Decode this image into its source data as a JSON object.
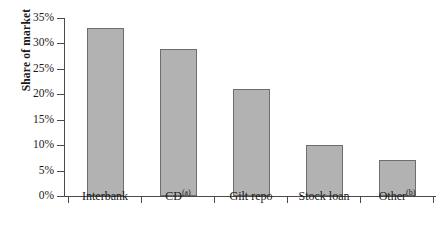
{
  "chart_data": {
    "type": "bar",
    "title": "",
    "xlabel": "",
    "ylabel": "Share of market",
    "categories": [
      "Interbank",
      "CD",
      "Gilt repo",
      "Stock loan",
      "Other"
    ],
    "category_footnotes": [
      "",
      "(a)",
      "",
      "",
      "(b)"
    ],
    "values": [
      33,
      29,
      21,
      10,
      7
    ],
    "ylim": [
      0,
      35
    ],
    "ytick_values": [
      0,
      5,
      10,
      15,
      20,
      25,
      30,
      35
    ],
    "ytick_labels": [
      "0%",
      "5%",
      "10%",
      "15%",
      "20%",
      "25%",
      "30%",
      "35%"
    ],
    "grid": false,
    "legend": "none",
    "bar_color": "#b2b2b2",
    "bar_border_color": "#6e6e6e",
    "axis_color": "#4a4a4a",
    "background": "#ffffff"
  }
}
